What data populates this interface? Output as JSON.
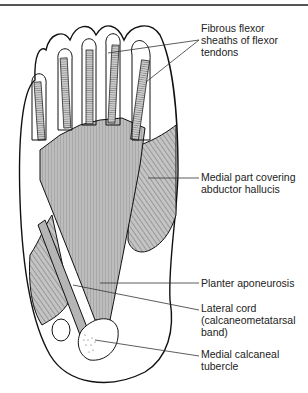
{
  "figure": {
    "labels": [
      {
        "id": "fibrous-flexor-sheaths",
        "text": "Fibrous flexor\nsheaths of flexor\ntendons",
        "x": 201,
        "y": 22
      },
      {
        "id": "medial-part",
        "text": "Medial part covering\nabductor hallucis",
        "x": 201,
        "y": 171
      },
      {
        "id": "planter-aponeurosis",
        "text": "Planter aponeurosis",
        "x": 201,
        "y": 275
      },
      {
        "id": "lateral-cord",
        "text": "Lateral cord\n(calcaneometatarsal\nband)",
        "x": 201,
        "y": 302
      },
      {
        "id": "medial-calcaneal-tubercle",
        "text": "Medial calcaneal\ntubercle",
        "x": 201,
        "y": 348
      }
    ]
  },
  "colors": {
    "fill": "#bdbdbd",
    "stroke": "#111111",
    "text": "#222222"
  }
}
